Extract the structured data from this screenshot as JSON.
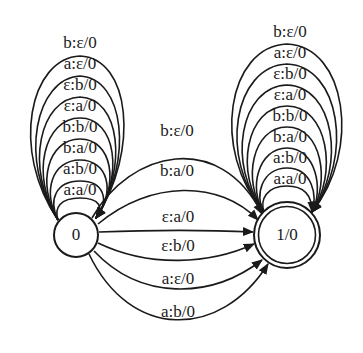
{
  "diagram": {
    "type": "finite-state transducer",
    "nodes": [
      {
        "id": "q0",
        "label": "0",
        "final": false
      },
      {
        "id": "q1",
        "label": "1/0",
        "final": true
      }
    ],
    "self_loops_q0": [
      "b:ε/0",
      "a:ε/0",
      "ε:b/0",
      "ε:a/0",
      "b:b/0",
      "b:a/0",
      "a:b/0",
      "a:a/0"
    ],
    "self_loops_q1": [
      "b:ε/0",
      "a:ε/0",
      "ε:b/0",
      "ε:a/0",
      "b:b/0",
      "b:a/0",
      "a:b/0",
      "a:a/0"
    ],
    "edges_q0_to_q1": [
      "b:ε/0",
      "b:a/0",
      "ε:a/0",
      "ε:b/0",
      "a:ε/0",
      "a:b/0"
    ]
  }
}
